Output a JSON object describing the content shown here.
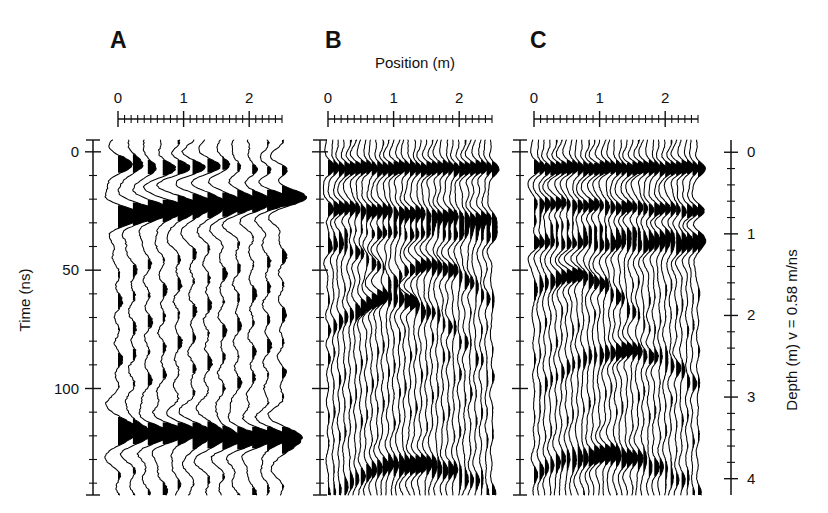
{
  "figure": {
    "type": "gpr-radargram-wiggle",
    "background": "#ffffff",
    "ink_color": "#000000",
    "width": 828,
    "height": 513
  },
  "panels": [
    {
      "id": "A",
      "letter": "A",
      "letter_x": 110,
      "letter_y": 48,
      "n_traces": 12
    },
    {
      "id": "B",
      "letter": "B",
      "letter_x": 325,
      "letter_y": 48,
      "n_traces": 31
    },
    {
      "id": "C",
      "letter": "C",
      "letter_x": 530,
      "letter_y": 48,
      "n_traces": 31
    }
  ],
  "axes": {
    "top": {
      "title": "Position (m)",
      "title_x": 415,
      "title_y": 68,
      "unit": "m",
      "major_ticks": [
        0,
        1,
        2
      ],
      "major_tick_labels": [
        "0",
        "1",
        "2"
      ],
      "minor_tick_step": 0.1,
      "range": [
        0,
        2.5
      ]
    },
    "left": {
      "title": "Time (ns)",
      "unit": "ns",
      "major_ticks": [
        0,
        50,
        100
      ],
      "major_tick_labels": [
        "0",
        "50",
        "100"
      ],
      "minor_tick_step": 10,
      "range": [
        -5,
        145
      ]
    },
    "right": {
      "title": "Depth (m) v = 0.58 m/ns",
      "unit": "m",
      "velocity": "0.58 m/ns",
      "major_ticks": [
        0,
        1,
        2,
        3,
        4
      ],
      "major_tick_labels": [
        "0",
        "1",
        "2",
        "3",
        "4"
      ],
      "minor_tick_step": 0.2,
      "range": [
        -0.15,
        4.2
      ]
    }
  },
  "chart_data": {
    "type": "line",
    "title": "",
    "subtitle": "",
    "xlabel": "Position (m)",
    "ylabel": "Time (ns)",
    "ylabel_right": "Depth (m) v = 0.58 m/ns",
    "xlim": [
      0,
      2.5
    ],
    "ylim": [
      -5,
      145
    ],
    "ylim_right": [
      -0.15,
      4.2
    ],
    "grid": false,
    "legend": "none",
    "panel_letters": [
      "A",
      "B",
      "C"
    ],
    "series": [
      {
        "name": "A",
        "n_traces": 12,
        "trace_positions_m": [
          0.0,
          0.22,
          0.44,
          0.66,
          0.88,
          1.1,
          1.32,
          1.54,
          1.76,
          1.98,
          2.2,
          2.42
        ],
        "events": [
          {
            "label": "direct-arrival",
            "t0_ns": 6,
            "dip_ns_per_m": 0.8,
            "amplitude": 0.55,
            "width_ns": 6
          },
          {
            "label": "shallow-reflector",
            "t0_ns": 27,
            "dip_ns_per_m": -3.5,
            "amplitude": 1.0,
            "width_ns": 8
          },
          {
            "label": "deep-reflector",
            "t0_ns": 118,
            "dip_ns_per_m": 1.5,
            "amplitude": 0.9,
            "width_ns": 8
          }
        ]
      },
      {
        "name": "B",
        "n_traces": 31,
        "trace_positions_m": [
          0.0,
          0.083,
          0.167,
          0.25,
          0.333,
          0.417,
          0.5,
          0.583,
          0.667,
          0.75,
          0.833,
          0.917,
          1.0,
          1.083,
          1.167,
          1.25,
          1.333,
          1.417,
          1.5,
          1.583,
          1.667,
          1.75,
          1.833,
          1.917,
          2.0,
          2.083,
          2.167,
          2.25,
          2.333,
          2.417,
          2.5
        ],
        "events": [
          {
            "label": "direct-arrival",
            "t0_ns": 7,
            "dip_ns_per_m": 0.0,
            "amplitude": 0.85,
            "width_ns": 5
          },
          {
            "label": "reflector-1",
            "t0_ns": 24,
            "dip_ns_per_m": 2.0,
            "amplitude": 1.0,
            "width_ns": 6
          },
          {
            "label": "reflector-2",
            "t0_ns": 33,
            "dip_ns_per_m": 1.0,
            "amplitude": 0.8,
            "width_ns": 6
          },
          {
            "label": "diffraction-apex-1",
            "apex_pos_m": 0.15,
            "apex_t_ns": 40,
            "amplitude": 0.9,
            "width_ns": 6
          },
          {
            "label": "diffraction-apex-2",
            "apex_pos_m": 0.95,
            "apex_t_ns": 62,
            "amplitude": 0.85,
            "width_ns": 6
          },
          {
            "label": "diffraction-apex-3",
            "apex_pos_m": 1.55,
            "apex_t_ns": 48,
            "amplitude": 0.8,
            "width_ns": 6
          },
          {
            "label": "deep-diffraction",
            "apex_pos_m": 1.25,
            "apex_t_ns": 132,
            "amplitude": 1.0,
            "width_ns": 7
          }
        ]
      },
      {
        "name": "C",
        "n_traces": 31,
        "trace_positions_m": [
          0.0,
          0.083,
          0.167,
          0.25,
          0.333,
          0.417,
          0.5,
          0.583,
          0.667,
          0.75,
          0.833,
          0.917,
          1.0,
          1.083,
          1.167,
          1.25,
          1.333,
          1.417,
          1.5,
          1.583,
          1.667,
          1.75,
          1.833,
          1.917,
          2.0,
          2.083,
          2.167,
          2.25,
          2.333,
          2.417,
          2.5
        ],
        "events": [
          {
            "label": "direct-arrival",
            "t0_ns": 7,
            "dip_ns_per_m": 0.0,
            "amplitude": 0.9,
            "width_ns": 5
          },
          {
            "label": "reflector-1",
            "t0_ns": 22,
            "dip_ns_per_m": 1.5,
            "amplitude": 1.0,
            "width_ns": 6
          },
          {
            "label": "reflector-2",
            "t0_ns": 30,
            "dip_ns_per_m": 2.0,
            "amplitude": 1.0,
            "width_ns": 6
          },
          {
            "label": "reflector-3",
            "t0_ns": 38,
            "dip_ns_per_m": 1.0,
            "amplitude": 0.95,
            "width_ns": 6
          },
          {
            "label": "diffraction-apex-1",
            "apex_pos_m": 0.55,
            "apex_t_ns": 52,
            "amplitude": 0.9,
            "width_ns": 6
          },
          {
            "label": "diffraction-apex-2",
            "apex_pos_m": 1.35,
            "apex_t_ns": 84,
            "amplitude": 0.8,
            "width_ns": 6
          },
          {
            "label": "deep-diffraction",
            "apex_pos_m": 1.05,
            "apex_t_ns": 128,
            "amplitude": 1.0,
            "width_ns": 7
          }
        ]
      }
    ]
  }
}
